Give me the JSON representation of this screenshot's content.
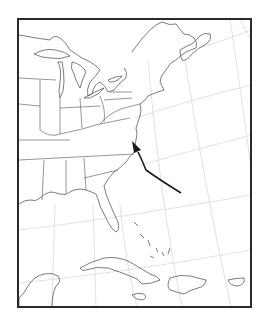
{
  "map": {
    "region": "Eastern United States, Gulf of Mexico and Caribbean",
    "projection_grid": "curved latitude/longitude graticule",
    "colors": {
      "background": "#ffffff",
      "frame": "#2a2a2a",
      "coastline": "#5a5a5a",
      "graticule": "#d4d4d4",
      "track": "#1a1a1a"
    },
    "features": [
      {
        "name": "Great Lakes"
      },
      {
        "name": "Atlantic coast"
      },
      {
        "name": "Florida"
      },
      {
        "name": "Gulf coast"
      },
      {
        "name": "Cuba"
      },
      {
        "name": "Hispaniola"
      },
      {
        "name": "Jamaica"
      },
      {
        "name": "Puerto Rico"
      },
      {
        "name": "Bahamas"
      },
      {
        "name": "Yucatan"
      },
      {
        "name": "Nova Scotia"
      }
    ],
    "track": {
      "description": "Storm track moving northwest, making landfall on the North Carolina / Virginia coast",
      "direction": "northwest"
    }
  }
}
